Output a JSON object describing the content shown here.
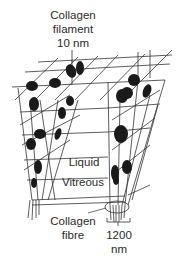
{
  "diagram": {
    "type": "schematic",
    "labels": {
      "filament_line1": "Collagen",
      "filament_line2": "filament",
      "filament_line3": "10 nm",
      "liquid": "Liquid",
      "vitreous": "Vitreous",
      "fibre_line1": "Collagen",
      "fibre_line2": "fibre",
      "fibre_size_line1": "1200",
      "fibre_size_line2": "nm"
    },
    "elements": [
      {
        "name": "collagen-filament-lattice",
        "description": "3D grid of thin collagen filaments"
      },
      {
        "name": "hyaluronan-clusters",
        "description": "dark molecular clusters along filaments"
      },
      {
        "name": "collagen-fibre-bundle",
        "description": "bundle of filaments converging into a fibre, encircled"
      },
      {
        "name": "scale-bracket",
        "description": "bracket indicating 1200 nm fibre width"
      }
    ],
    "colors": {
      "line": "#333333",
      "cluster": "#1a1a1a",
      "background": "#ffffff"
    }
  }
}
